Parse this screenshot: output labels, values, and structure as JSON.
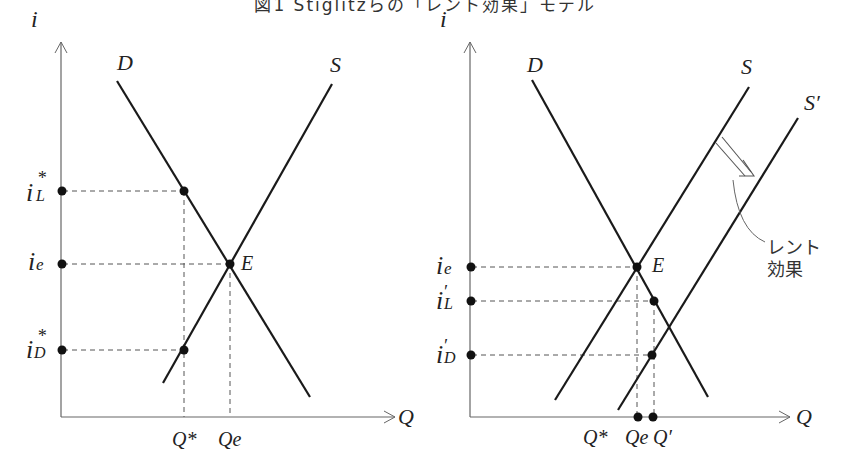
{
  "title": "図1 Stiglitzらの「レント効果」モデル",
  "colors": {
    "line": "#1a1a1a",
    "axis": "#666666",
    "dash": "#555555",
    "text": "#222222"
  },
  "left_panel": {
    "y_axis": "i",
    "x_axis": "Q",
    "curves": {
      "demand": "D",
      "supply": "S"
    },
    "equilibrium": "E",
    "y_labels": {
      "iL": "i",
      "iL_sub": "L",
      "iL_sup": "*",
      "ie": "i",
      "ie_sub": "e",
      "iD": "i",
      "iD_sub": "D",
      "iD_sup": "*"
    },
    "x_labels": {
      "qstar": "Q*",
      "qe": "Qe"
    }
  },
  "right_panel": {
    "y_axis": "i",
    "x_axis": "Q",
    "curves": {
      "demand": "D",
      "supply": "S",
      "supply_shifted": "S′"
    },
    "equilibrium": "E",
    "y_labels": {
      "ie": "i",
      "ie_sub": "e",
      "iL": "i",
      "iL_sub": "L",
      "iL_sup": "′",
      "iD": "i",
      "iD_sub": "D",
      "iD_sup": "′"
    },
    "x_labels": {
      "qstar": "Q*",
      "qe": "Qe",
      "qprime": "Q′"
    },
    "annotation": {
      "line1": "レント",
      "line2": "効果"
    }
  }
}
